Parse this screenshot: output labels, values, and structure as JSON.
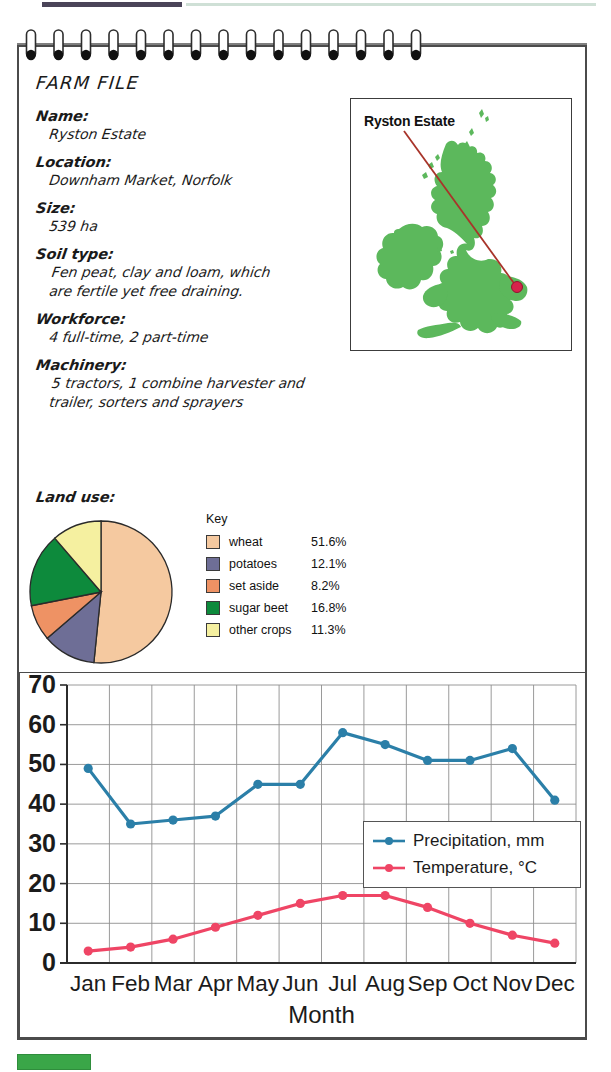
{
  "page": {
    "title": "FARM FILE",
    "bottom_tab_color": "#3aa648",
    "top_bar_color": "#4a4458"
  },
  "farm_file": {
    "heading": "FARM FILE",
    "fields": [
      {
        "label": "Name:",
        "value": "Ryston Estate"
      },
      {
        "label": "Location:",
        "value": "Downham Market, Norfolk"
      },
      {
        "label": "Size:",
        "value": "539 ha"
      },
      {
        "label": "Soil type:",
        "value": "Fen peat, clay and loam, which\nare fertile yet free draining."
      },
      {
        "label": "Workforce:",
        "value": "4 full-time, 2 part-time"
      },
      {
        "label": "Machinery:",
        "value": "5 tractors, 1 combine harvester and\ntrailer, sorters and sprayers"
      }
    ],
    "land_use_label": "Land use:"
  },
  "map": {
    "label": "Ryston Estate",
    "land_color": "#5cb85c",
    "marker_color": "#d6234b",
    "leader_color": "#a8342a"
  },
  "key": {
    "title": "Key",
    "items": [
      {
        "name": "wheat",
        "pct": "51.6%",
        "color": "#f5c9a0"
      },
      {
        "name": "potatoes",
        "pct": "12.1%",
        "color": "#6e6e96"
      },
      {
        "name": "set aside",
        "pct": "8.2%",
        "color": "#ee9264"
      },
      {
        "name": "sugar beet",
        "pct": "16.8%",
        "color": "#0d8a3c"
      },
      {
        "name": "other crops",
        "pct": "11.3%",
        "color": "#f5f0a0"
      }
    ]
  },
  "chart_data": {
    "type": "line",
    "title": "",
    "xlabel": "Month",
    "ylabel": "",
    "x": [
      "Jan",
      "Feb",
      "Mar",
      "Apr",
      "May",
      "Jun",
      "Jul",
      "Aug",
      "Sep",
      "Oct",
      "Nov",
      "Dec"
    ],
    "categories": [
      "Jan",
      "Feb",
      "Mar",
      "Apr",
      "May",
      "Jun",
      "Jul",
      "Aug",
      "Sep",
      "Oct",
      "Nov",
      "Dec"
    ],
    "yticks": [
      0,
      10,
      20,
      30,
      40,
      50,
      60,
      70
    ],
    "ylim": [
      0,
      70
    ],
    "grid": true,
    "legend_position": "inside-right",
    "series": [
      {
        "name": "Precipitation, mm",
        "color": "#2b7fa8",
        "values": [
          49,
          35,
          36,
          37,
          45,
          45,
          58,
          55,
          51,
          51,
          54,
          41
        ]
      },
      {
        "name": "Temperature, °C",
        "color": "#ef4565",
        "values": [
          3,
          4,
          6,
          9,
          12,
          15,
          17,
          17,
          14,
          10,
          7,
          5
        ]
      }
    ]
  },
  "pie_chart": {
    "type": "pie",
    "slices": [
      {
        "label": "wheat",
        "value": 51.6,
        "color": "#f5c9a0"
      },
      {
        "label": "potatoes",
        "value": 12.1,
        "color": "#6e6e96"
      },
      {
        "label": "set aside",
        "value": 8.2,
        "color": "#ee9264"
      },
      {
        "label": "sugar beet",
        "value": 16.8,
        "color": "#0d8a3c"
      },
      {
        "label": "other crops",
        "value": 11.3,
        "color": "#f5f0a0"
      }
    ]
  }
}
